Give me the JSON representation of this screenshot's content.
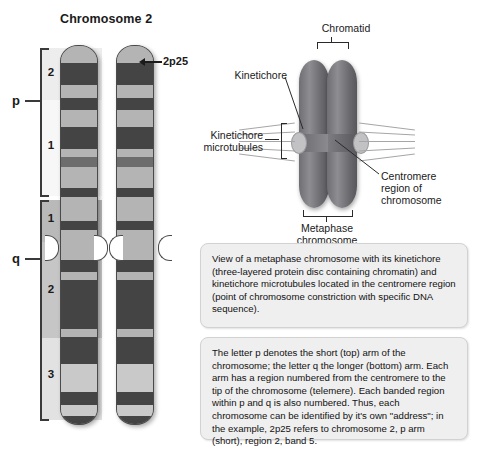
{
  "ideogram": {
    "title": "Chromosome 2",
    "callout_label": "2p25",
    "arms": [
      {
        "letter": "p",
        "name": "short-arm"
      },
      {
        "letter": "q",
        "name": "long-arm"
      }
    ],
    "regions": [
      {
        "arm": "p",
        "number": "2",
        "bands": [
          "5",
          "4",
          "3",
          "2",
          "1"
        ]
      },
      {
        "arm": "p",
        "number": "1",
        "bands": [
          "6",
          "5",
          "4",
          "3",
          "2",
          "1"
        ]
      },
      {
        "arm": "q",
        "number": "1",
        "bands": [
          "1",
          "2",
          "3",
          "4"
        ]
      },
      {
        "arm": "q",
        "number": "2",
        "bands": [
          "1",
          "2",
          "3",
          "4"
        ]
      },
      {
        "arm": "q",
        "number": "3",
        "bands": [
          "1",
          "2",
          "3",
          "4",
          "5",
          "6",
          "7"
        ]
      }
    ]
  },
  "metaphase_figure": {
    "labels": {
      "chromatid": "Chromatid",
      "kinetichore": "Kinetichore",
      "kinetichore_microtubules": "Kinetichore\nmicrotubules",
      "kinetichore_microtubules_line1": "Kinetichore",
      "kinetichore_microtubules_line2": "microtubules",
      "centromere_line1": "Centromere",
      "centromere_line2": "region of",
      "centromere_line3": "chromosome",
      "metaphase_line1": "Metaphase",
      "metaphase_line2": "chromosome"
    }
  },
  "textboxes": [
    {
      "id": "kinetichore-description",
      "text": "View of a metaphase chromosome with its kinetichore (three-layered protein disc containing chromatin) and kinetichore microtubules located in the centromere region (point of chromosome constriction with specific DNA sequence)."
    },
    {
      "id": "nomenclature-description",
      "text": "The letter p denotes the short (top) arm of the chromosome; the letter q the longer (bottom) arm. Each arm has a region numbered from the centromere to the tip of the chromosome (telemere). Each banded region within p and q is also numbered. Thus, each chromosome can be identified by it's own \"address\"; in the example, 2p25 refers to chromosome 2, p arm (short), region 2, band 5."
    }
  ],
  "colors": {
    "band_dark": "#444444",
    "band_mid": "#6d6d6d",
    "band_light": "#b4b4b4",
    "chromatid_body": "#9e9e9e",
    "textbox_bg": "#efefef"
  }
}
